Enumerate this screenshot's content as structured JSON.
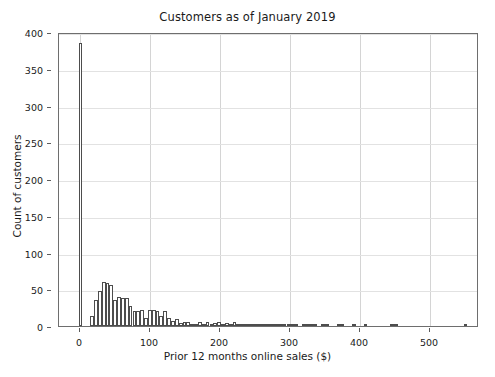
{
  "chart_data": {
    "type": "bar",
    "title": "Customers as of January 2019",
    "xlabel": "Prior 12 months online sales ($)",
    "ylabel": "Count of customers",
    "xlim": [
      -30,
      570
    ],
    "ylim": [
      0,
      400
    ],
    "xticks": [
      0,
      100,
      200,
      300,
      400,
      500
    ],
    "yticks": [
      0,
      50,
      100,
      150,
      200,
      250,
      300,
      350,
      400
    ],
    "xtick_labels": [
      "0",
      "100",
      "200",
      "300",
      "400",
      "500"
    ],
    "ytick_labels": [
      "0",
      "50",
      "100",
      "150",
      "200",
      "250",
      "300",
      "350",
      "400"
    ],
    "grid": true,
    "legend": "none",
    "bin_width": 5.5,
    "bin_starts": [
      -2,
      3.5,
      9,
      14.5,
      20,
      25.5,
      31,
      36.5,
      42,
      47.5,
      53,
      58.5,
      64,
      69.5,
      75,
      80.5,
      86,
      91.5,
      97,
      102.5,
      108,
      113.5,
      119,
      124.5,
      130,
      135.5,
      141,
      146.5,
      152,
      157.5,
      163,
      168.5,
      174,
      179.5,
      185,
      190.5,
      196,
      201.5,
      207,
      212.5,
      218,
      223.5,
      229,
      234.5,
      240,
      245.5,
      251,
      256.5,
      262,
      267.5,
      273,
      278.5,
      284,
      289.5,
      295,
      300.5,
      306,
      311.5,
      317,
      322.5,
      328,
      333.5,
      339,
      344.5,
      350,
      355.5,
      361,
      366.5,
      372,
      377.5,
      383,
      388.5,
      394,
      399.5,
      405,
      410.5,
      416,
      421.5,
      427,
      432.5,
      438,
      443.5,
      449,
      454.5,
      460,
      465.5,
      471,
      476.5,
      482,
      487.5,
      493,
      498.5,
      504,
      509.5,
      515,
      520.5,
      526,
      531.5,
      537,
      542.5,
      548
    ],
    "values": [
      385,
      0,
      0,
      14,
      35,
      48,
      60,
      59,
      56,
      35,
      39,
      38,
      38,
      27,
      21,
      20,
      22,
      11,
      22,
      22,
      21,
      13,
      21,
      11,
      7,
      9,
      4,
      6,
      5,
      3,
      3,
      5,
      3,
      5,
      3,
      4,
      5,
      3,
      4,
      3,
      5,
      2,
      2,
      2,
      2,
      2,
      2,
      1,
      2,
      1,
      2,
      1,
      1,
      2,
      1,
      2,
      1,
      0,
      1,
      1,
      1,
      1,
      0,
      1,
      1,
      0,
      0,
      1,
      1,
      0,
      0,
      1,
      0,
      0,
      1,
      0,
      0,
      0,
      0,
      0,
      0,
      1,
      1,
      0,
      0,
      0,
      0,
      0,
      0,
      0,
      0,
      0,
      0,
      0,
      0,
      0,
      0,
      0,
      0,
      0,
      1
    ]
  },
  "axis_style": {
    "frame_color": "#6e6e6e",
    "grid_color": "#d4d4d4",
    "bar_edge_color": "#4d4d4d",
    "bar_fill_color": "#ffffff",
    "text_color": "#1a1a1a",
    "background_color": "#ffffff"
  }
}
